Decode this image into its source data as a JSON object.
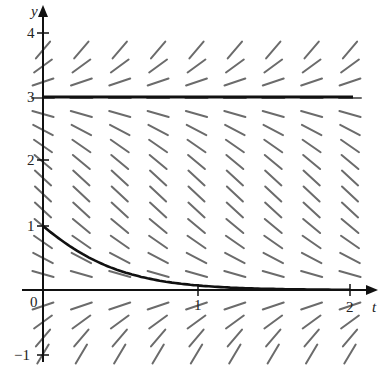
{
  "figure": {
    "type": "slope-field",
    "equation_shape": "dy/dt = y(y - 3)",
    "axes": {
      "x_label": "t",
      "y_label": "y",
      "x_ticks": [
        {
          "value": 0,
          "label": "0"
        },
        {
          "value": 1,
          "label": "1"
        },
        {
          "value": 2,
          "label": "2"
        }
      ],
      "y_ticks": [
        {
          "value": -1,
          "label": "−1"
        },
        {
          "value": 1,
          "label": "1"
        },
        {
          "value": 2,
          "label": "2"
        },
        {
          "value": 3,
          "label": "3"
        },
        {
          "value": 4,
          "label": "4"
        }
      ],
      "x_range": [
        0,
        2
      ],
      "y_range": [
        -1,
        4
      ]
    },
    "equilibrium_solutions": [
      {
        "y": 3,
        "label": "y = 3"
      },
      {
        "y": 0,
        "label": "y = 0"
      }
    ],
    "solution_curve": {
      "initial_condition": {
        "t": 0,
        "y": 1
      },
      "behavior": "decays toward y = 0"
    },
    "colors": {
      "axis": "#111111",
      "segments": "#6b6b6b",
      "solution": "#111111"
    }
  },
  "labels": {
    "x_axis": "t",
    "y_axis": "y",
    "tick_0": "0",
    "tick_x1": "1",
    "tick_x2": "2",
    "tick_y1": "1",
    "tick_y2": "2",
    "tick_y3": "3",
    "tick_y4": "4",
    "tick_ym1": "−1"
  }
}
